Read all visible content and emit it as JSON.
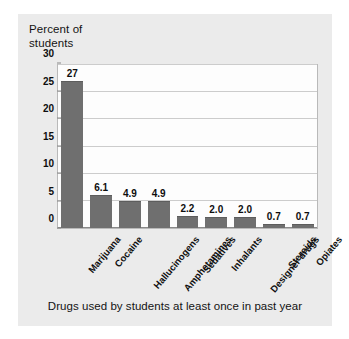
{
  "card": {
    "background_color": "#ebebeb",
    "caption": "Drugs used by students at least once in past year"
  },
  "chart_data": {
    "type": "bar",
    "title": "",
    "subtitle": "",
    "caption": "Drugs used by students at least once in past year",
    "xlabel": "",
    "ylabel": "Percent of\nstudents",
    "ylim": [
      0,
      30
    ],
    "yticks": [
      0,
      5,
      10,
      15,
      20,
      25,
      30
    ],
    "ytick_labels": [
      "0",
      "5",
      "10",
      "15",
      "20",
      "25",
      "30"
    ],
    "grid": true,
    "grid_axis": "y",
    "legend": false,
    "legend_position": "none",
    "bar_color": "#6f6f6f",
    "plot_background": "#fdfdfd",
    "categories": [
      "Marijuana",
      "Cocaine",
      "Hallucinogens",
      "Amphetamines",
      "Sedatives",
      "Inhalants",
      "Designer drugs",
      "Steroids",
      "Opiates"
    ],
    "values": [
      27,
      6.1,
      4.9,
      4.9,
      2.2,
      2.0,
      2.0,
      0.7,
      0.7
    ],
    "value_labels": [
      "27",
      "6.1",
      "4.9",
      "4.9",
      "2.2",
      "2.0",
      "2.0",
      "0.7",
      "0.7"
    ]
  }
}
